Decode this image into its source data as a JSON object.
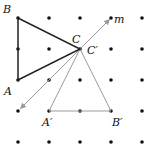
{
  "diagram": {
    "grid": {
      "xs": [
        18,
        49,
        80,
        111,
        142
      ],
      "ys": [
        18,
        49,
        80,
        111,
        142
      ],
      "dot_color": "#111111"
    },
    "original_triangle": {
      "color": "#222222",
      "vertices": {
        "A": [
          18,
          80
        ],
        "B": [
          18,
          18
        ],
        "C": [
          80,
          49
        ]
      }
    },
    "image_triangle": {
      "color": "#9a9a9a",
      "vertices": {
        "A'": [
          49,
          111
        ],
        "B'": [
          111,
          111
        ],
        "C'": [
          80,
          49
        ]
      }
    },
    "line_m": {
      "color": "#9a9a9a",
      "from": [
        20,
        109
      ],
      "to": [
        110,
        19
      ]
    },
    "labels": {
      "A": "A",
      "B": "B",
      "C": "C",
      "C_prime": "C′",
      "A_prime": "A′",
      "B_prime": "B′",
      "m": "m"
    }
  }
}
